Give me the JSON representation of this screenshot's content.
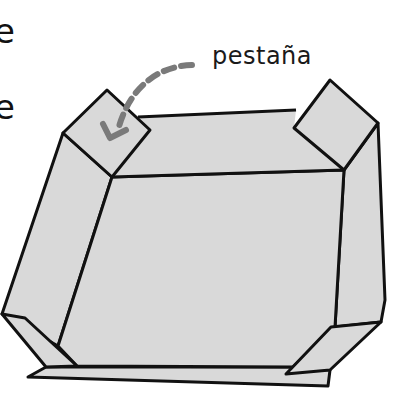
{
  "diagram": {
    "type": "box-net-illustration",
    "labels": {
      "tab": "pestaña"
    },
    "cropped_left_text": [
      "e",
      "e"
    ],
    "colors": {
      "paper_fill": "#d9d9d9",
      "outline": "#111111",
      "arrow": "#777777",
      "background": "#ffffff"
    },
    "parts": [
      "left-tab",
      "right-tab",
      "floor",
      "left-wall",
      "right-wall",
      "front-strip",
      "left-corner-flap",
      "right-corner-flap"
    ]
  }
}
